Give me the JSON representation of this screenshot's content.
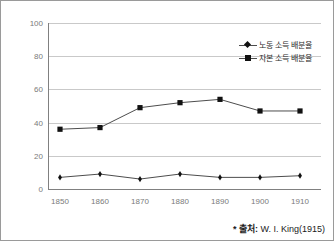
{
  "chart_data": {
    "type": "line",
    "title": "",
    "xlabel": "",
    "ylabel": "",
    "x": [
      1850,
      1860,
      1870,
      1880,
      1890,
      1900,
      1910
    ],
    "categories": [
      "1850",
      "1860",
      "1870",
      "1880",
      "1890",
      "1900",
      "1910"
    ],
    "series": [
      {
        "name": "노동 소득 배분율",
        "marker": "diamond",
        "color": "#111111",
        "values": [
          7,
          9,
          6,
          9,
          7,
          7,
          8
        ]
      },
      {
        "name": "자본 소득 배분율",
        "marker": "square",
        "color": "#111111",
        "values": [
          36,
          37,
          49,
          52,
          54,
          47,
          47
        ]
      }
    ],
    "ylim": [
      0,
      100
    ],
    "yticks": [
      0,
      20,
      40,
      60,
      80,
      100
    ],
    "ytick_labels": [
      "0",
      "20",
      "40",
      "60",
      "80",
      "100"
    ],
    "grid": "horizontal",
    "legend_position": "top-right"
  },
  "legend": {
    "entries": [
      {
        "label": "노동 소득 배분율"
      },
      {
        "label": "자본 소득 배분율"
      }
    ]
  },
  "source": {
    "star": "*",
    "label": "출처:",
    "text": "W. I. King(1915)",
    "full": "* 출처: W. I. King(1915)"
  },
  "colors": {
    "series_line": "#4d4d4d",
    "marker": "#111111",
    "gridline": "#c9c9c9",
    "axis": "#808080",
    "tick_text": "#7a7a7a",
    "frame": "#9a9a9a",
    "background": "#ffffff"
  }
}
